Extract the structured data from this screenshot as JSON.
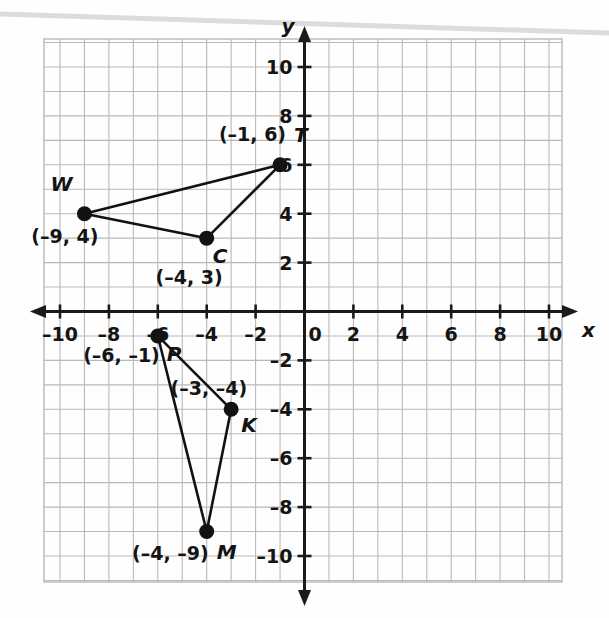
{
  "chart_data": {
    "type": "scatter",
    "title": "",
    "xlabel": "x",
    "ylabel": "y",
    "xlim": [
      -11,
      11
    ],
    "ylim": [
      -11,
      11
    ],
    "grid": true,
    "grid_step": 1,
    "tick_step": 2,
    "legend": "none",
    "x_ticks": [
      {
        "value": -10,
        "label": "–10"
      },
      {
        "value": -8,
        "label": "–8"
      },
      {
        "value": -6,
        "label": "–6"
      },
      {
        "value": -4,
        "label": "–4"
      },
      {
        "value": -2,
        "label": "–2"
      },
      {
        "value": 0,
        "label": "0"
      },
      {
        "value": 2,
        "label": "2"
      },
      {
        "value": 4,
        "label": "4"
      },
      {
        "value": 6,
        "label": "6"
      },
      {
        "value": 8,
        "label": "8"
      },
      {
        "value": 10,
        "label": "10"
      }
    ],
    "y_ticks": [
      {
        "value": 10,
        "label": "10"
      },
      {
        "value": 8,
        "label": "8"
      },
      {
        "value": 6,
        "label": "6"
      },
      {
        "value": 4,
        "label": "4"
      },
      {
        "value": 2,
        "label": "2"
      },
      {
        "value": -2,
        "label": "–2"
      },
      {
        "value": -4,
        "label": "–4"
      },
      {
        "value": -6,
        "label": "–6"
      },
      {
        "value": -8,
        "label": "–8"
      },
      {
        "value": -10,
        "label": "–10"
      }
    ],
    "points": [
      {
        "name": "T",
        "x": -1,
        "y": 6,
        "coord_label": "(–1, 6)"
      },
      {
        "name": "W",
        "x": -9,
        "y": 4,
        "coord_label": "(–9, 4)"
      },
      {
        "name": "C",
        "x": -4,
        "y": 3,
        "coord_label": "(–4, 3)"
      },
      {
        "name": "P",
        "x": -6,
        "y": -1,
        "coord_label": "(–6, –1)"
      },
      {
        "name": "K",
        "x": -3,
        "y": -4,
        "coord_label": "(–3, –4)"
      },
      {
        "name": "M",
        "x": -4,
        "y": -9,
        "coord_label": "(–4, –9)"
      }
    ],
    "polygons": [
      {
        "name": "triangle-WCT",
        "vertices": [
          "W",
          "C",
          "T"
        ]
      },
      {
        "name": "triangle-PKM",
        "vertices": [
          "P",
          "K",
          "M"
        ]
      }
    ],
    "colors": {
      "grid": "#b9b9b9",
      "axis": "#1a1a1a",
      "point": "#121212",
      "segment": "#121212",
      "text": "#141414",
      "background": "#ffffff"
    }
  },
  "axis_labels": {
    "x": "x",
    "y": "y"
  },
  "point_labels": {
    "T": {
      "name": "T",
      "coord": "(–1, 6)"
    },
    "W": {
      "name": "W",
      "coord": "(–9, 4)"
    },
    "C": {
      "name": "C",
      "coord": "(–4, 3)"
    },
    "P": {
      "name": "P",
      "coord": "(–6, –1)"
    },
    "K": {
      "name": "K",
      "coord": "(–3, –4)"
    },
    "M": {
      "name": "M",
      "coord": "(–4, –9)"
    }
  }
}
